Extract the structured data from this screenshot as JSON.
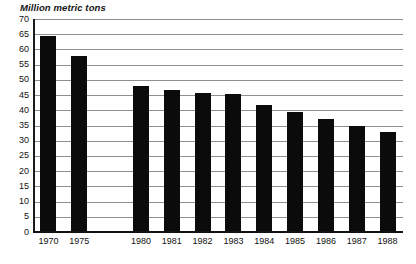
{
  "chart_data": {
    "type": "bar",
    "title": "Million metric tons",
    "subtitle": "",
    "xlabel": "",
    "ylabel": "Million metric tons",
    "ylim": [
      0,
      70
    ],
    "ytick_step": 5,
    "ytick_labels": [
      "70",
      "65",
      "60",
      "55",
      "50",
      "45",
      "40",
      "35",
      "30",
      "25",
      "20",
      "15",
      "10",
      "5",
      "0"
    ],
    "ytick_values": [
      70,
      65,
      60,
      55,
      50,
      45,
      40,
      35,
      30,
      25,
      20,
      15,
      10,
      5,
      0
    ],
    "grid": true,
    "grid_orientation": "horizontal",
    "legend": false,
    "legend_position": "none",
    "bar_color": "#0b0b0b",
    "grid_color": "#8f8f8f",
    "axis_color": "#111111",
    "categories": [
      "1970",
      "1975",
      "1980",
      "1981",
      "1982",
      "1983",
      "1984",
      "1985",
      "1986",
      "1987",
      "1988"
    ],
    "values": [
      64.5,
      57.8,
      48.0,
      46.8,
      45.7,
      45.2,
      41.6,
      39.5,
      37.2,
      35.0,
      32.8
    ],
    "category_gap_after_index": 1
  }
}
